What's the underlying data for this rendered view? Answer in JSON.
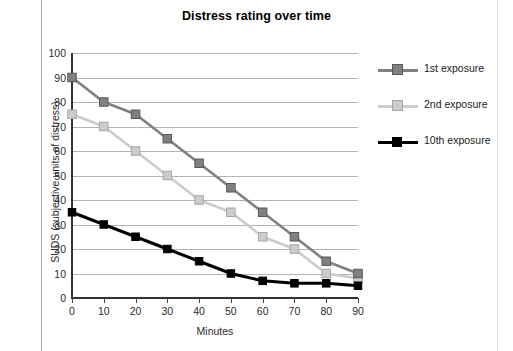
{
  "chart_data": {
    "type": "line",
    "title": "Distress rating over time",
    "xlabel": "Minutes",
    "ylabel": "SUDS (subjective units of distress)",
    "x": [
      0,
      10,
      20,
      30,
      40,
      50,
      60,
      70,
      80,
      90
    ],
    "xlim": [
      0,
      90
    ],
    "ylim": [
      0,
      100
    ],
    "ytick_labels": [
      "0",
      "10",
      "20",
      "30",
      "40",
      "50",
      "60",
      "70",
      "80",
      "90",
      "100"
    ],
    "yticks": [
      0,
      10,
      20,
      30,
      40,
      50,
      60,
      70,
      80,
      90,
      100
    ],
    "xtick_labels": [
      "0",
      "10",
      "20",
      "30",
      "40",
      "50",
      "60",
      "70",
      "80",
      "90"
    ],
    "grid": "horizontal",
    "legend_position": "right",
    "marker": "square",
    "series": [
      {
        "name": "1st exposure",
        "color": "#808080",
        "marker_fill": "#808080",
        "marker_edge": "#595959",
        "values": [
          90,
          80,
          75,
          65,
          55,
          45,
          35,
          25,
          15,
          10
        ]
      },
      {
        "name": "2nd exposure",
        "color": "#cccccc",
        "marker_fill": "#cccccc",
        "marker_edge": "#a6a6a6",
        "values": [
          75,
          70,
          60,
          50,
          40,
          35,
          25,
          20,
          10,
          8
        ]
      },
      {
        "name": "10th exposure",
        "color": "#000000",
        "marker_fill": "#000000",
        "marker_edge": "#000000",
        "values": [
          35,
          30,
          25,
          20,
          15,
          10,
          7,
          6,
          6,
          5
        ]
      }
    ]
  },
  "colors": {
    "grid": "#b3b3b3",
    "axis": "#333333",
    "text": "#2b2b2b",
    "page_rule": "#a9a9a9"
  }
}
